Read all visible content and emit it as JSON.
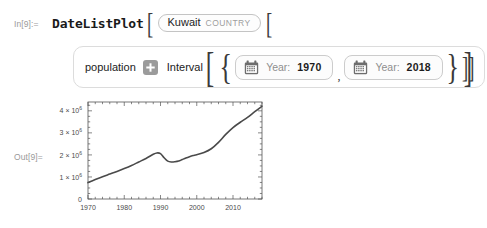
{
  "cells": {
    "input": {
      "label": "In[9]:=",
      "function_name": "DateListPlot",
      "open_bracket": "[",
      "entity": {
        "name": "Kuwait",
        "type": "COUNTRY"
      },
      "second_open_bracket": "[",
      "property": {
        "label": "population",
        "add_icon": "plus-icon"
      },
      "interval_keyword": "Interval",
      "interval_open_bracket": "[",
      "interval_open_brace": "{",
      "dates": [
        {
          "calendar_icon": "calendar-icon",
          "key": "Year:",
          "value": "1970"
        },
        {
          "calendar_icon": "calendar-icon",
          "key": "Year:",
          "value": "2018"
        }
      ],
      "separator": ",",
      "interval_close_brace": "}",
      "interval_close_bracket": "]",
      "trailing_brackets": "]]"
    },
    "output": {
      "label": "Out[9]="
    }
  },
  "chart_data": {
    "type": "line",
    "title": "",
    "xlabel": "",
    "ylabel": "",
    "xlim": [
      1970,
      2018
    ],
    "ylim": [
      0,
      4400000
    ],
    "grid": false,
    "legend": null,
    "frame": true,
    "line_color": "#4a4a4a",
    "xticks": [
      1970,
      1980,
      1990,
      2000,
      2010
    ],
    "xtick_labels": [
      "1970",
      "1980",
      "1990",
      "2000",
      "2010"
    ],
    "yticks": [
      0,
      1000000,
      2000000,
      3000000,
      4000000
    ],
    "ytick_labels": [
      "0",
      "1×10⁶",
      "2×10⁶",
      "3×10⁶",
      "4×10⁶"
    ],
    "series": [
      {
        "name": "Kuwait population",
        "x": [
          1970,
          1972,
          1974,
          1976,
          1978,
          1980,
          1982,
          1984,
          1986,
          1988,
          1989,
          1990,
          1991,
          1992,
          1993,
          1994,
          1995,
          1996,
          1997,
          1998,
          1999,
          2000,
          2002,
          2004,
          2006,
          2008,
          2010,
          2012,
          2014,
          2016,
          2018
        ],
        "y": [
          744000,
          880000,
          1010000,
          1130000,
          1250000,
          1380000,
          1520000,
          1680000,
          1840000,
          2030000,
          2090000,
          2060000,
          1870000,
          1720000,
          1680000,
          1690000,
          1720000,
          1790000,
          1860000,
          1920000,
          1970000,
          2010000,
          2110000,
          2280000,
          2570000,
          2930000,
          3240000,
          3480000,
          3700000,
          3960000,
          4210000
        ]
      }
    ]
  }
}
